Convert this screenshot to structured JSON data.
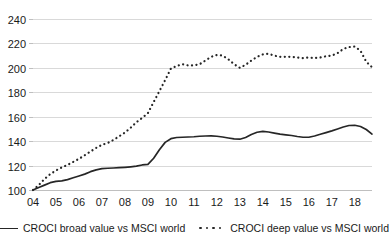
{
  "chart_data": {
    "type": "line",
    "title": "",
    "xlabel": "",
    "ylabel": "",
    "ylim": [
      100,
      240
    ],
    "xlim": [
      2004,
      2018.75
    ],
    "grid": true,
    "legend_position": "bottom",
    "ytick_labels": [
      "240",
      "220",
      "200",
      "180",
      "160",
      "140",
      "120",
      "100"
    ],
    "ytick_values": [
      240,
      220,
      200,
      180,
      160,
      140,
      120,
      100
    ],
    "xtick_labels": [
      "04",
      "05",
      "06",
      "07",
      "08",
      "09",
      "10",
      "11",
      "12",
      "13",
      "14",
      "15",
      "16",
      "17",
      "18"
    ],
    "xtick_values": [
      2004,
      2005,
      2006,
      2007,
      2008,
      2009,
      2010,
      2011,
      2012,
      2013,
      2014,
      2015,
      2016,
      2017,
      2018
    ],
    "x": [
      2004.0,
      2004.25,
      2004.5,
      2004.75,
      2005.0,
      2005.25,
      2005.5,
      2005.75,
      2006.0,
      2006.25,
      2006.5,
      2006.75,
      2007.0,
      2007.25,
      2007.5,
      2007.75,
      2008.0,
      2008.25,
      2008.5,
      2008.75,
      2009.0,
      2009.25,
      2009.5,
      2009.75,
      2010.0,
      2010.25,
      2010.5,
      2010.75,
      2011.0,
      2011.25,
      2011.5,
      2011.75,
      2012.0,
      2012.25,
      2012.5,
      2012.75,
      2013.0,
      2013.25,
      2013.5,
      2013.75,
      2014.0,
      2014.25,
      2014.5,
      2014.75,
      2015.0,
      2015.25,
      2015.5,
      2015.75,
      2016.0,
      2016.25,
      2016.5,
      2016.75,
      2017.0,
      2017.25,
      2017.5,
      2017.75,
      2018.0,
      2018.25,
      2018.5,
      2018.75
    ],
    "series": [
      {
        "name": "CROCI broad value vs MSCI world",
        "style": "solid",
        "color": "#262626",
        "values": [
          100,
          102,
          104,
          106,
          107,
          107.5,
          108.5,
          110,
          111.5,
          113,
          115,
          116.5,
          117.5,
          117.8,
          118,
          118.3,
          118.6,
          119,
          119.5,
          120.5,
          121,
          126,
          133,
          139,
          142,
          143,
          143.2,
          143.4,
          143.6,
          144,
          144.2,
          144.3,
          144,
          143.4,
          142.6,
          141.8,
          141.6,
          143,
          145.5,
          147.3,
          148,
          147.5,
          146.6,
          145.8,
          145.2,
          144.6,
          143.8,
          143.2,
          143.2,
          144.2,
          145.6,
          147,
          148.4,
          150,
          151.6,
          152.8,
          153,
          152,
          149.5,
          145.8
        ]
      },
      {
        "name": "CROCI deep value vs MSCI world",
        "style": "dotted",
        "color": "#262626",
        "values": [
          100,
          104,
          109,
          113,
          116,
          118.5,
          120.5,
          123,
          125.5,
          128.5,
          131.5,
          134.5,
          137,
          138.5,
          141,
          144,
          147,
          151,
          155.5,
          159,
          163,
          172,
          181,
          190,
          199.5,
          201.5,
          203,
          202,
          202,
          203,
          206,
          209,
          210.5,
          210,
          207,
          203,
          200,
          202.5,
          206,
          209,
          211,
          211.5,
          210,
          209,
          209,
          209,
          208.5,
          208,
          208.5,
          208,
          208.5,
          209.5,
          210,
          212,
          215.5,
          217,
          217.5,
          214,
          205,
          200.5
        ]
      }
    ]
  },
  "legend": {
    "entries": [
      {
        "label": "CROCI broad value vs MSCI world",
        "marker": "solid-line-swatch"
      },
      {
        "label": "CROCI deep value vs MSCI world",
        "marker": "dotted-line-swatch"
      }
    ]
  }
}
